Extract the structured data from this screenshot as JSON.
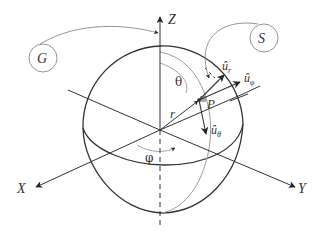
{
  "diagram": {
    "axes": {
      "x": "X",
      "y": "Y",
      "z": "Z"
    },
    "point": "P",
    "radius_label": "r",
    "angles": {
      "polar": "θ",
      "azimuth": "φ"
    },
    "unit_vectors": {
      "u_r": {
        "base": "û",
        "sub": "r"
      },
      "u_phi": {
        "base": "û",
        "sub": "φ"
      },
      "u_theta": {
        "base": "û",
        "sub": "θ"
      }
    },
    "callouts": {
      "G": "G",
      "S": "S"
    },
    "colors": {
      "stroke_dark": "#333333",
      "stroke_light": "#9a9a9a",
      "point": "#999999"
    }
  }
}
